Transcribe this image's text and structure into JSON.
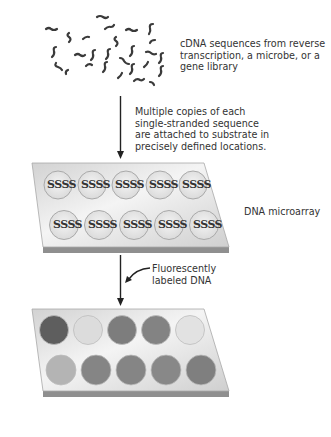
{
  "labels": {
    "cdna": [
      "cDNA sequences from reverse",
      "transcription, a microbe, or a",
      "gene library"
    ],
    "attach": [
      "Multiple copies of each",
      "single-stranded sequence",
      "are attached to substrate in",
      "precisely defined locations."
    ],
    "microarray": "DNA microarray",
    "fluor": [
      "Fluorescently",
      "labeled DNA"
    ]
  },
  "probe_glyph": "SSSS",
  "array_top": {
    "spots_row1": 5,
    "spots_row2": 5
  },
  "array_bottom": {
    "row1_colors": [
      "#5e5e5e",
      "#dcdcdc",
      "#7d7d7d",
      "#838383",
      "#e2e2e2"
    ],
    "row2_colors": [
      "#b4b4b4",
      "#858585",
      "#858585",
      "#888888",
      "#7f7f7f"
    ]
  },
  "colors": {
    "slide_top": "#e6e6e6",
    "slide_edge": "#9a9a9a",
    "arrow": "#222222"
  }
}
